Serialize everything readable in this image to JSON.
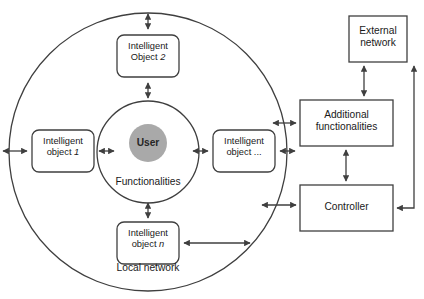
{
  "diagram": {
    "colors": {
      "stroke": "#3f3f3f",
      "box_fill": "#ffffff",
      "user_fill": "#a9a9a9",
      "background": "#ffffff",
      "text": "#1a1a1a"
    },
    "inner_circle": {
      "user_label": "User",
      "functionalities_label": "Functionalities"
    },
    "outer_circle": {
      "label": "Local network"
    },
    "intelligent_objects": [
      {
        "line1": "Intelligent",
        "line2": "Object ",
        "index": "2",
        "name": "intelligent-object-2"
      },
      {
        "line1": "Intelligent",
        "line2": "object ",
        "index": "1",
        "name": "intelligent-object-1"
      },
      {
        "line1": "Intelligent",
        "line2": "object ",
        "index": "...",
        "name": "intelligent-object-dots"
      },
      {
        "line1": "Intelligent",
        "line2": "object ",
        "index": "n",
        "name": "intelligent-object-n"
      }
    ],
    "external_boxes": [
      {
        "line1": "External",
        "line2": "network",
        "name": "external-network"
      },
      {
        "line1": "Additional",
        "line2": "functionalities",
        "name": "additional-functionalities"
      },
      {
        "line1": "Controller",
        "line2": "",
        "name": "controller"
      }
    ]
  }
}
